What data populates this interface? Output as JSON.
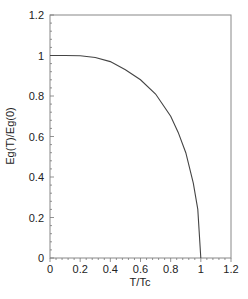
{
  "chart_data": {
    "type": "line",
    "title": "",
    "xlabel": "T/Tc",
    "ylabel": "Eg(T)/Eg(0)",
    "xlim": [
      0,
      1.2
    ],
    "ylim": [
      0,
      1.2
    ],
    "grid": false,
    "legend": null,
    "xticks": [
      "0",
      "0.2",
      "0.4",
      "0.6",
      "0.8",
      "1",
      "1.2"
    ],
    "yticks": [
      "0",
      "0.2",
      "0.4",
      "0.6",
      "0.8",
      "1",
      "1.2"
    ],
    "series": [
      {
        "name": "Eg(T)/Eg(0)",
        "x": [
          0,
          0.1,
          0.2,
          0.3,
          0.4,
          0.5,
          0.6,
          0.7,
          0.8,
          0.85,
          0.9,
          0.95,
          0.98,
          1.0
        ],
        "y": [
          1.0,
          1.0,
          0.999,
          0.99,
          0.97,
          0.93,
          0.88,
          0.81,
          0.7,
          0.62,
          0.52,
          0.37,
          0.24,
          0.0
        ]
      }
    ]
  }
}
